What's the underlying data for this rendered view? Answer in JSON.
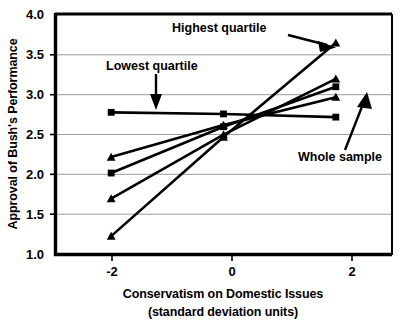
{
  "chart_data": {
    "type": "line",
    "title": "",
    "xlabel": "Conservatism on Domestic Issues",
    "xlabel_line2": "(standard deviation units)",
    "ylabel": "Approval of Bush's Performance",
    "xlim": [
      -3,
      3
    ],
    "ylim": [
      1.0,
      4.0
    ],
    "grid": true,
    "grid_axis": "y",
    "legend_position": "none",
    "x": [
      -2,
      0,
      2
    ],
    "xticks": [
      -2,
      0,
      2
    ],
    "xtick_labels": [
      "-2",
      "0",
      "2"
    ],
    "yticks": [
      1.0,
      1.5,
      2.0,
      2.5,
      3.0,
      3.5,
      4.0
    ],
    "ytick_labels": [
      "1.0",
      "1.5",
      "2.0",
      "2.5",
      "3.0",
      "3.5",
      "4.0"
    ],
    "series": [
      {
        "name": "Lowest quartile",
        "marker": "square",
        "values": [
          2.78,
          2.76,
          2.72
        ]
      },
      {
        "name": "Second quartile",
        "marker": "triangle",
        "values": [
          2.22,
          2.62,
          2.97
        ]
      },
      {
        "name": "Whole sample",
        "marker": "square",
        "values": [
          2.02,
          2.6,
          3.1
        ]
      },
      {
        "name": "Third quartile",
        "marker": "triangle",
        "values": [
          1.7,
          2.5,
          3.2
        ]
      },
      {
        "name": "Highest quartile",
        "marker": "triangle",
        "values": [
          1.23,
          2.47,
          3.65
        ]
      }
    ],
    "annotations": [
      {
        "label": "Highest quartile",
        "target_series": "Highest quartile"
      },
      {
        "label": "Lowest quartile",
        "target_series": "Lowest quartile"
      },
      {
        "label": "Whole sample",
        "target_series": "Whole sample"
      }
    ]
  },
  "labels": {
    "y_axis_title": "Approval of Bush's Performance",
    "x_axis_title": "Conservatism on Domestic Issues",
    "x_axis_subtitle": "(standard deviation units)",
    "annotation_highest": "Highest quartile",
    "annotation_lowest": "Lowest quartile",
    "annotation_whole": "Whole sample"
  },
  "ticks": {
    "y": [
      "4.0",
      "3.5",
      "3.0",
      "2.5",
      "2.0",
      "1.5",
      "1.0"
    ],
    "x": [
      "-2",
      "0",
      "2"
    ]
  },
  "colors": {
    "ink": "#000000",
    "grid": "#9a9a9a",
    "background": "#ffffff"
  }
}
